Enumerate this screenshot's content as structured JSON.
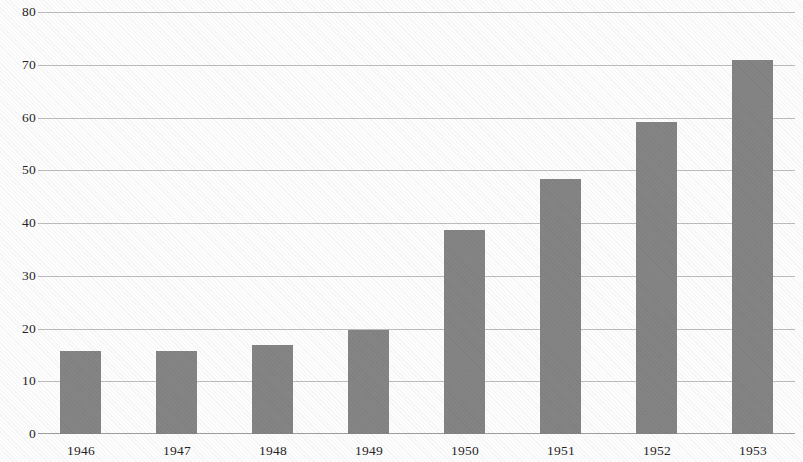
{
  "chart_data": {
    "type": "bar",
    "title": "",
    "subtitle": "",
    "xlabel": "",
    "ylabel": "",
    "categories": [
      "1946",
      "1947",
      "1948",
      "1949",
      "1950",
      "1951",
      "1952",
      "1953"
    ],
    "values": [
      15.8,
      15.8,
      17.0,
      19.8,
      38.7,
      48.4,
      59.3,
      71.0
    ],
    "series": [
      {
        "name": "",
        "values": [
          15.8,
          15.8,
          17.0,
          19.8,
          38.7,
          48.4,
          59.3,
          71.0
        ]
      }
    ],
    "ylim": [
      0,
      80
    ],
    "yticks": [
      0,
      10,
      20,
      30,
      40,
      50,
      60,
      70,
      80
    ],
    "ytick_labels": [
      "0",
      "10",
      "20",
      "30",
      "40",
      "50",
      "60",
      "70",
      "80"
    ],
    "grid": true,
    "grid_axis": "y",
    "legend": false,
    "legend_position": "none",
    "bar_color": "#858585",
    "grid_color": "#b9b9b9",
    "axis_color": "#9a9a9a",
    "text_color": "#25251f",
    "background_color": "#fdfdfd"
  }
}
